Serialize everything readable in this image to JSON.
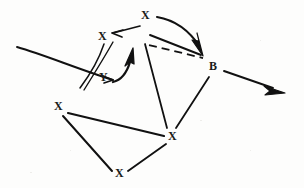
{
  "canvas": {
    "width": 304,
    "height": 188,
    "background_color": "#fdfdfc",
    "ink_color": "#111111",
    "title": "Hand-drawn directed graph sketch"
  },
  "nodes": [
    {
      "id": "x_top",
      "label": "X",
      "x": 145,
      "y": 15,
      "name": "node-x-top"
    },
    {
      "id": "x_upleft",
      "label": "X",
      "x": 102,
      "y": 36,
      "name": "node-x-upper-left"
    },
    {
      "id": "y",
      "label": "Y",
      "x": 103,
      "y": 77,
      "name": "node-y"
    },
    {
      "id": "b",
      "label": "B",
      "x": 213,
      "y": 66,
      "name": "node-b"
    },
    {
      "id": "x_left",
      "label": "X",
      "x": 58,
      "y": 106,
      "name": "node-x-left"
    },
    {
      "id": "x_mid",
      "label": "X",
      "x": 172,
      "y": 136,
      "name": "node-x-middle"
    },
    {
      "id": "x_bottom",
      "label": "X",
      "x": 119,
      "y": 173,
      "name": "node-x-bottom"
    }
  ],
  "edges": [
    {
      "id": "e1",
      "from": "x_top",
      "to": "b",
      "style": "curved",
      "arrow": "filled",
      "name": "edge-x-top-to-b-curved"
    },
    {
      "id": "e2",
      "from": "x_top",
      "to": "b",
      "style": "straight",
      "arrow": "none",
      "name": "edge-x-top-to-b-straight"
    },
    {
      "id": "e3",
      "from": "x_top",
      "to": "b",
      "style": "dashed",
      "arrow": "none",
      "name": "edge-x-top-to-b-dashed"
    },
    {
      "id": "e4",
      "from": "x_top",
      "to": "x_upleft",
      "style": "straight",
      "arrow": "open",
      "name": "edge-x-top-to-x-upper-left"
    },
    {
      "id": "e5",
      "from": "y",
      "to": "x_top",
      "style": "curved",
      "arrow": "filled",
      "name": "edge-y-to-x-top"
    },
    {
      "id": "e6",
      "from": "x_upleft",
      "to": "y",
      "style": "straight",
      "arrow": "none",
      "name": "edge-x-upper-left-to-y"
    },
    {
      "id": "e7",
      "from": "far_left",
      "to": "y",
      "style": "straight",
      "arrow": "open",
      "name": "edge-incoming-left-to-y"
    },
    {
      "id": "e8",
      "from": "x_left",
      "to": "x_mid",
      "style": "straight",
      "arrow": "none",
      "name": "edge-x-left-to-x-middle"
    },
    {
      "id": "e9",
      "from": "x_left",
      "to": "x_bottom",
      "style": "straight",
      "arrow": "none",
      "name": "edge-x-left-to-x-bottom"
    },
    {
      "id": "e10",
      "from": "x_bottom",
      "to": "x_mid",
      "style": "straight",
      "arrow": "none",
      "name": "edge-x-bottom-to-x-middle"
    },
    {
      "id": "e11",
      "from": "x_mid",
      "to": "x_top",
      "style": "straight",
      "arrow": "none",
      "name": "edge-x-middle-to-x-top"
    },
    {
      "id": "e12",
      "from": "x_mid",
      "to": "b",
      "style": "straight",
      "arrow": "none",
      "name": "edge-x-middle-to-b"
    },
    {
      "id": "e13",
      "from": "b",
      "to": "out_right",
      "style": "straight",
      "arrow": "filled",
      "name": "edge-b-to-outgoing-right"
    }
  ],
  "labels": {
    "x_top": "X",
    "x_upleft": "X",
    "y": "Y",
    "b": "B",
    "x_left": "X",
    "x_mid": "X",
    "x_bottom": "X"
  }
}
